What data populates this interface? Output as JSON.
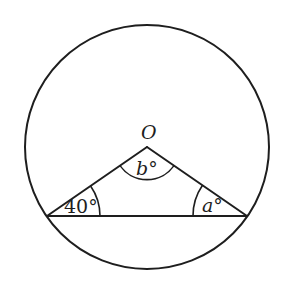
{
  "diagram": {
    "type": "circle-geometry",
    "circle": {
      "center": "O",
      "cx": 147,
      "cy": 147,
      "r": 122
    },
    "points": {
      "O": {
        "x": 147,
        "y": 147
      },
      "left_chord_end": {
        "x": 47,
        "y": 216
      },
      "right_chord_end": {
        "x": 247,
        "y": 216
      }
    },
    "labels": {
      "center": "O",
      "apex_angle": "b°",
      "left_angle": "40°",
      "right_angle": "a°"
    },
    "angles": [
      {
        "vertex": "O",
        "label": "b°",
        "arc_radius": 33
      },
      {
        "vertex": "left_chord_end",
        "label": "40°",
        "value": 40,
        "arc_radius": 53
      },
      {
        "vertex": "right_chord_end",
        "label": "a°",
        "arc_radius": 54
      }
    ],
    "colors": {
      "stroke": "#1e1e1e",
      "background": "#ffffff"
    }
  }
}
